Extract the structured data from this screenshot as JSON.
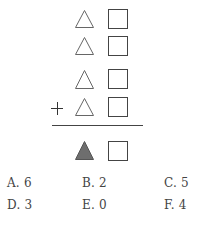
{
  "puzzle": {
    "rows": [
      {
        "triangle": "outline",
        "square": "outline"
      },
      {
        "triangle": "outline",
        "square": "outline"
      },
      {
        "triangle": "outline",
        "square": "outline"
      },
      {
        "triangle": "outline",
        "square": "outline",
        "operator": "+"
      }
    ],
    "result": {
      "triangle": "filled",
      "square": "outline"
    },
    "operator": "+",
    "colors": {
      "outline": "#555555",
      "filled": "#6e6e6e"
    }
  },
  "options": [
    {
      "label": "A. 6"
    },
    {
      "label": "B. 2"
    },
    {
      "label": "C. 5"
    },
    {
      "label": "D. 3"
    },
    {
      "label": "E. 0"
    },
    {
      "label": "F. 4"
    }
  ]
}
